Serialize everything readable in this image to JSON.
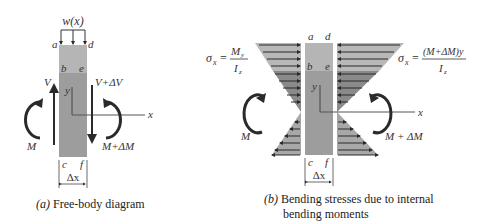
{
  "colors": {
    "beam_top": "#b5b5b5",
    "beam_body": "#9d9d9d",
    "stress_light": "#b8b8b8",
    "stress_dark": "#8a8a8a",
    "arrow": "#2a2a2a",
    "line": "#555555"
  },
  "panel_a": {
    "load_label": "w(x)",
    "corners": {
      "a": "a",
      "d": "d",
      "b": "b",
      "e": "e",
      "c": "c",
      "f": "f"
    },
    "shear_left": "V",
    "shear_right": "V+ΔV",
    "moment_left": "M",
    "moment_right": "M+ΔM",
    "axis_y": "y",
    "axis_x": "x",
    "width_label": "Δx",
    "caption_prefix": "(a)",
    "caption_text": " Free-body diagram"
  },
  "panel_b": {
    "corners": {
      "a": "a",
      "d": "d",
      "b": "b",
      "e": "e",
      "c": "c",
      "f": "f"
    },
    "formula_left": {
      "lhs": "σ",
      "lhs_sub": "x",
      "eq": "=",
      "num": "M",
      "num_sub": "y",
      "den": "I",
      "den_sub": "z"
    },
    "formula_right": {
      "lhs": "σ",
      "lhs_sub": "x",
      "eq": "=",
      "num": "(M+ΔM)y",
      "den": "I",
      "den_sub": "z"
    },
    "moment_left": "M",
    "moment_right": "M + ΔM",
    "axis_y": "y",
    "axis_x": "x",
    "width_label": "Δx",
    "caption_prefix": "(b)",
    "caption_line1": " Bending stresses due to internal",
    "caption_line2": "bending moments"
  }
}
